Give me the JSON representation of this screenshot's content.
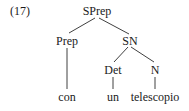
{
  "example_number": "(17)",
  "tree": {
    "root": "SPrep",
    "nodes": {
      "sprep": "SPrep",
      "prep": "Prep",
      "sn": "SN",
      "det": "Det",
      "n": "N"
    },
    "leaves": {
      "con": "con",
      "un": "un",
      "telescopio": "telescopio"
    },
    "structure": "[SPrep [Prep con] [SN [Det un] [N telescopio]]]"
  }
}
